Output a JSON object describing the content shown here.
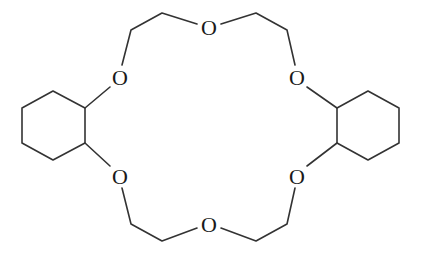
{
  "diagram": {
    "colors": {
      "bond": "#333333",
      "atom_label": "#1a1a1a",
      "background": "#ffffff"
    },
    "atoms": [
      {
        "id": "O_top",
        "label": "O",
        "x": 209,
        "y": 27
      },
      {
        "id": "O_upper_left",
        "label": "O",
        "x": 120,
        "y": 77
      },
      {
        "id": "O_upper_right",
        "label": "O",
        "x": 297,
        "y": 77
      },
      {
        "id": "O_lower_left",
        "label": "O",
        "x": 120,
        "y": 176
      },
      {
        "id": "O_lower_right",
        "label": "O",
        "x": 297,
        "y": 176
      },
      {
        "id": "O_bottom",
        "label": "O",
        "x": 209,
        "y": 224
      }
    ],
    "rings": [
      {
        "id": "left-cyclohexane",
        "points": "22,108 53,91 85,108 85,143 53,160 22,143"
      },
      {
        "id": "right-cyclohexane",
        "points": "337,108 368,91 399,108 399,143 368,160 337,143"
      }
    ],
    "bonds": [
      {
        "id": "b1",
        "points": "85,108 110,87"
      },
      {
        "id": "b2",
        "points": "122,65 131,30 162,13 197,24"
      },
      {
        "id": "b3",
        "points": "221,24 256,13 287,30 295,65"
      },
      {
        "id": "b4",
        "points": "307,87 337,108"
      },
      {
        "id": "b5",
        "points": "85,143 110,166"
      },
      {
        "id": "b6",
        "points": "122,188 131,224 162,241 197,228"
      },
      {
        "id": "b7",
        "points": "221,228 256,241 287,224 295,188"
      },
      {
        "id": "b8",
        "points": "307,166 337,143"
      }
    ]
  }
}
